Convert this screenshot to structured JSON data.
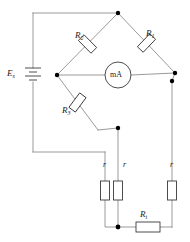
{
  "diagram": {
    "type": "circuit-schematic",
    "width": 190,
    "height": 242,
    "colors": {
      "wire": "#808080",
      "component_outline": "#3a3a3a",
      "node": "#000000",
      "text": "#1a1a1a",
      "background": "#ffffff"
    }
  },
  "labels": {
    "source": {
      "symbol": "E",
      "subscript": "s"
    },
    "r1": {
      "symbol": "R",
      "subscript": "1"
    },
    "r2": {
      "symbol": "R",
      "subscript": "2"
    },
    "r3": {
      "symbol": "R",
      "subscript": "3"
    },
    "rt": {
      "symbol": "R",
      "subscript": "t"
    },
    "lead_left": "r",
    "lead_mid": "r",
    "lead_right": "r",
    "meter": "mA"
  },
  "components": [
    {
      "id": "source",
      "name": "dc-voltage-source",
      "label": "Es",
      "orientation": "vertical"
    },
    {
      "id": "r1",
      "name": "resistor-r1",
      "label": "R1",
      "orientation": "diagonal"
    },
    {
      "id": "r2",
      "name": "resistor-r2",
      "label": "R2",
      "orientation": "diagonal"
    },
    {
      "id": "r3",
      "name": "resistor-r3",
      "label": "R3",
      "orientation": "diagonal"
    },
    {
      "id": "rt",
      "name": "resistor-rt",
      "label": "Rt",
      "orientation": "horizontal"
    },
    {
      "id": "lead_left",
      "name": "lead-resistance-left",
      "label": "r",
      "orientation": "vertical"
    },
    {
      "id": "lead_mid",
      "name": "lead-resistance-mid",
      "label": "r",
      "orientation": "vertical"
    },
    {
      "id": "lead_right",
      "name": "lead-resistance-right",
      "label": "r",
      "orientation": "vertical"
    },
    {
      "id": "meter",
      "name": "milliammeter",
      "label": "mA",
      "orientation": "horizontal"
    }
  ],
  "nodes": [
    {
      "id": "top",
      "name": "bridge-node-top"
    },
    {
      "id": "left",
      "name": "bridge-node-left"
    },
    {
      "id": "right",
      "name": "bridge-node-right"
    },
    {
      "id": "right_low",
      "name": "junction-right-lower"
    },
    {
      "id": "mid",
      "name": "junction-mid-upper"
    },
    {
      "id": "bottom",
      "name": "junction-bottom"
    }
  ]
}
